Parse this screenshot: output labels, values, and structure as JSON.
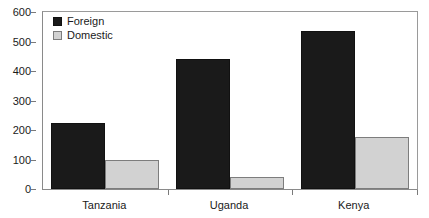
{
  "chart_data": {
    "type": "bar",
    "title": "",
    "subtitle": "",
    "xlabel": "",
    "ylabel": "",
    "categories": [
      "Tanzania",
      "Uganda",
      "Kenya"
    ],
    "series": [
      {
        "name": "Foreign",
        "color": "#1a1a1a",
        "values": [
          223,
          440,
          535
        ]
      },
      {
        "name": "Domestic",
        "color": "#d2d2d2",
        "values": [
          100,
          42,
          175
        ]
      }
    ],
    "ylim": [
      0,
      600
    ],
    "ytick_values": [
      0,
      100,
      200,
      300,
      400,
      500,
      600
    ],
    "ytick_labels": [
      "0",
      "100",
      "200",
      "300",
      "400",
      "500",
      "600"
    ],
    "grid": false,
    "legend_position": "top-left",
    "legend_entries": [
      "Foreign",
      "Domestic"
    ],
    "annotations": []
  }
}
